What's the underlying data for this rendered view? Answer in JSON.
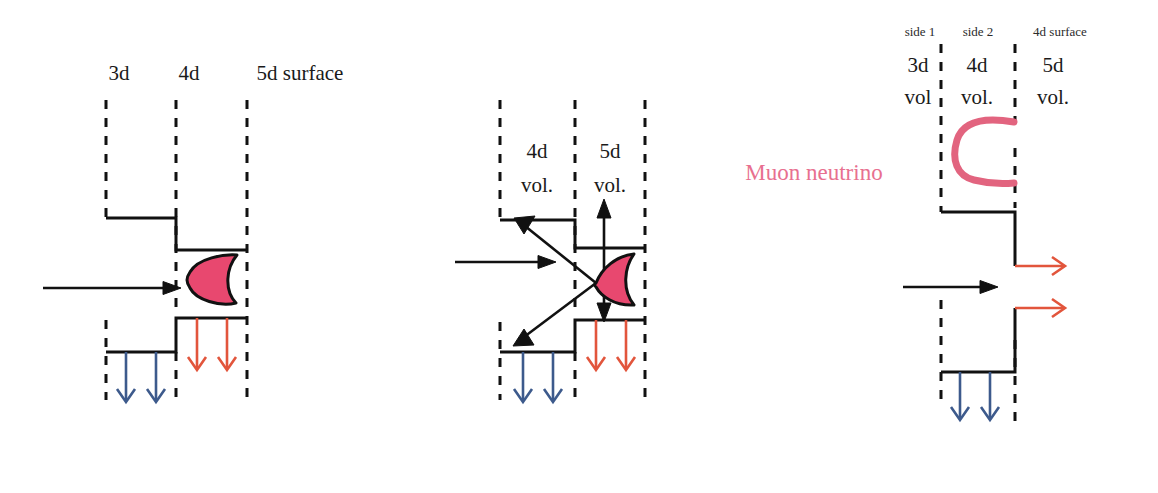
{
  "figure": {
    "background": "#ffffff",
    "colors": {
      "line": "#111111",
      "pink_fill": "#e8486f",
      "pink_stroke": "#111111",
      "pink_text": "#e8708f",
      "pink_curve": "#e2647f",
      "blue_arrow": "#3d5a8c",
      "red_arrow": "#e2553c",
      "black_arrow": "#111111"
    }
  },
  "panel_left": {
    "name": "incoming-neutrino-panel",
    "headers": [
      {
        "id": "3d",
        "label": "3d"
      },
      {
        "id": "4d",
        "label": "4d"
      },
      {
        "id": "5d-surface",
        "label": "5d surface"
      }
    ],
    "incoming_arrow": {
      "color": "#111111",
      "direction": "right"
    },
    "blob": {
      "shape": "crescent-leaf",
      "fill": "#e8486f",
      "orientation": "concave-right"
    },
    "blue_arrows": {
      "count": 2,
      "color": "#3d5a8c",
      "direction": "down"
    },
    "red_arrows": {
      "count": 2,
      "color": "#e2553c",
      "direction": "down"
    }
  },
  "panel_middle": {
    "name": "scattering-panel",
    "region_labels": [
      {
        "id": "4d-vol",
        "line1": "4d",
        "line2": "vol."
      },
      {
        "id": "5d-vol",
        "line1": "5d",
        "line2": "vol."
      }
    ],
    "incoming_arrow": {
      "color": "#111111",
      "direction": "right"
    },
    "blob": {
      "shape": "crescent-leaf",
      "fill": "#e8486f",
      "orientation": "concave-right"
    },
    "scatter_arrows": [
      {
        "id": "up-left",
        "direction": "up-left",
        "color": "#111111"
      },
      {
        "id": "down-left",
        "direction": "down-left",
        "color": "#111111"
      },
      {
        "id": "up",
        "direction": "up",
        "color": "#111111"
      },
      {
        "id": "down",
        "direction": "down",
        "color": "#111111"
      }
    ],
    "blue_arrows": {
      "count": 2,
      "color": "#3d5a8c",
      "direction": "down"
    },
    "red_arrows": {
      "count": 2,
      "color": "#e2553c",
      "direction": "down"
    }
  },
  "panel_right": {
    "name": "muon-neutrino-panel",
    "annotation": {
      "id": "muon-neutrino",
      "text": "Muon neutrino",
      "color": "#e8708f"
    },
    "side_headers": [
      {
        "id": "side-1",
        "label": "side 1"
      },
      {
        "id": "side-2",
        "label": "side 2"
      },
      {
        "id": "4d-surface",
        "label": "4d surface"
      }
    ],
    "volume_labels": [
      {
        "id": "3d-vol",
        "line1": "3d",
        "line2": "vol"
      },
      {
        "id": "4d-vol",
        "line1": "4d",
        "line2": "vol."
      },
      {
        "id": "5d-vol",
        "line1": "5d",
        "line2": "vol."
      }
    ],
    "pink_curve": {
      "id": "c-shape",
      "shape": "C-bracket-open-right",
      "color": "#e2647f"
    },
    "incoming_arrow": {
      "color": "#111111",
      "direction": "right"
    },
    "red_arrows": {
      "count": 2,
      "color": "#e2553c",
      "direction": "right"
    },
    "blue_arrows": {
      "count": 2,
      "color": "#3d5a8c",
      "direction": "down"
    }
  }
}
